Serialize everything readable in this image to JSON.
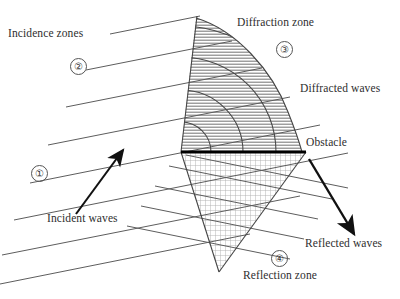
{
  "figure": {
    "type": "wave-propagation-diagram",
    "background": "#ffffff",
    "ink": "#2b2b2b",
    "title_absent": true
  },
  "labels": {
    "incidence_zones": "Incidence zones",
    "diffraction_zone": "Diffraction zone",
    "diffracted_waves": "Diffracted waves",
    "obstacle": "Obstacle",
    "reflected_waves": "Reflected waves",
    "reflection_zone": "Reflection zone",
    "incident_waves": "Incident waves"
  },
  "zone_numbers": {
    "one": "①",
    "two": "②",
    "three": "③",
    "four": "④"
  },
  "zones": [
    {
      "id": "1",
      "marker": "①",
      "name": "Incidence zone 1",
      "fill": "none",
      "x": 31,
      "y": 165
    },
    {
      "id": "2",
      "marker": "②",
      "name": "Incidence zone 2",
      "fill": "none",
      "x": 70,
      "y": 58
    },
    {
      "id": "3",
      "marker": "③",
      "name": "Diffraction zone",
      "fill": "horizontal-hatch",
      "x": 276,
      "y": 41
    },
    {
      "id": "4",
      "marker": "④",
      "name": "Reflection zone",
      "fill": "cross-hatch-grid",
      "x": 271,
      "y": 250
    }
  ],
  "arrows": [
    {
      "name": "incident-waves-arrow",
      "from": [
        76,
        214
      ],
      "to": [
        124,
        148
      ],
      "direction": "up-right"
    },
    {
      "name": "reflected-waves-arrow",
      "from": [
        309,
        159
      ],
      "to": [
        356,
        237
      ],
      "direction": "down-right"
    }
  ],
  "obstacle_line": {
    "x1": 181,
    "y1": 152,
    "x2": 306,
    "y2": 152,
    "thickness": 3,
    "color": "#000000"
  },
  "wave_fronts": {
    "incident_parallel_lines": 7,
    "reflected_parallel_lines": 5,
    "diffraction_arcs": 4,
    "angle_note": "incident fronts rise to the right"
  }
}
